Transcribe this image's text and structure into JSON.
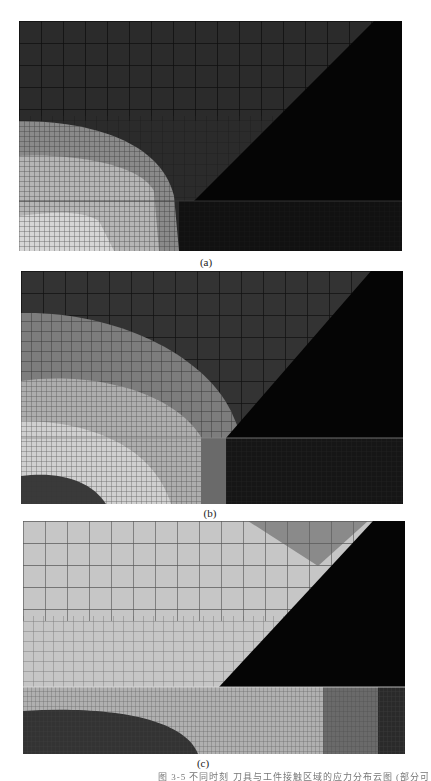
{
  "figure": {
    "panels": [
      {
        "id": "a",
        "label": "(a)",
        "description": "FEM mesh contour plot — bright region in lower-left, dark elsewhere"
      },
      {
        "id": "b",
        "label": "(b)",
        "description": "FEM mesh contour plot — larger bright quarter-ellipse spreading from lower-left"
      },
      {
        "id": "c",
        "label": "(c)",
        "description": "FEM mesh contour plot — mostly bright upper region, dark lower-left dome"
      }
    ],
    "caption": "图 3-5  不同时刻 刀具与工件接触区域的应力分布云图 (部分可见)",
    "colors": {
      "background": "#ffffff",
      "tool_black": "#050505",
      "dark_region": "#2a2a2a",
      "mid_region": "#7a7a7a",
      "light_region": "#c8c8c8",
      "mesh_line": "#111111"
    }
  }
}
